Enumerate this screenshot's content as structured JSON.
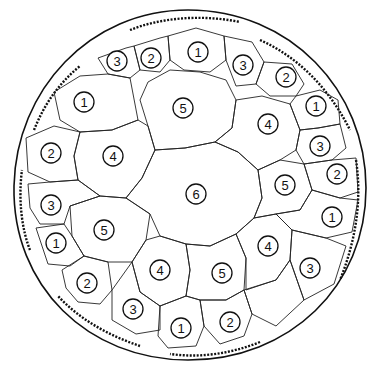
{
  "diagram": {
    "type": "circular cell map",
    "outer_circle": {
      "cx": 188,
      "cy": 188,
      "r": 178
    },
    "colors": {
      "line": "#111111",
      "background": "#ffffff"
    },
    "cells": [
      {
        "label": "1",
        "x": 198,
        "y": 52
      },
      {
        "label": "2",
        "x": 151,
        "y": 58
      },
      {
        "label": "3",
        "x": 117,
        "y": 61
      },
      {
        "label": "3",
        "x": 243,
        "y": 65
      },
      {
        "label": "2",
        "x": 286,
        "y": 77
      },
      {
        "label": "1",
        "x": 84,
        "y": 102
      },
      {
        "label": "5",
        "x": 183,
        "y": 108
      },
      {
        "label": "1",
        "x": 316,
        "y": 106
      },
      {
        "label": "4",
        "x": 268,
        "y": 124
      },
      {
        "label": "3",
        "x": 320,
        "y": 146
      },
      {
        "label": "2",
        "x": 51,
        "y": 153
      },
      {
        "label": "4",
        "x": 113,
        "y": 156
      },
      {
        "label": "2",
        "x": 337,
        "y": 174
      },
      {
        "label": "6",
        "x": 196,
        "y": 194
      },
      {
        "label": "5",
        "x": 285,
        "y": 185
      },
      {
        "label": "3",
        "x": 51,
        "y": 205
      },
      {
        "label": "5",
        "x": 104,
        "y": 230
      },
      {
        "label": "1",
        "x": 332,
        "y": 217
      },
      {
        "label": "1",
        "x": 56,
        "y": 243
      },
      {
        "label": "4",
        "x": 268,
        "y": 246
      },
      {
        "label": "4",
        "x": 160,
        "y": 270
      },
      {
        "label": "5",
        "x": 222,
        "y": 273
      },
      {
        "label": "3",
        "x": 310,
        "y": 268
      },
      {
        "label": "2",
        "x": 87,
        "y": 283
      },
      {
        "label": "3",
        "x": 133,
        "y": 309
      },
      {
        "label": "1",
        "x": 181,
        "y": 328
      },
      {
        "label": "2",
        "x": 230,
        "y": 322
      }
    ]
  }
}
